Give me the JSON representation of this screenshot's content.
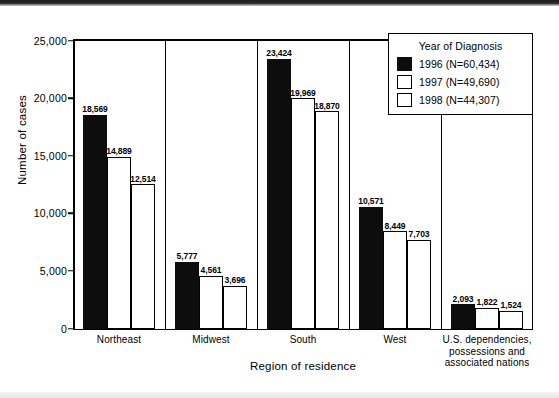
{
  "chart_data": {
    "type": "bar",
    "title": "",
    "xlabel": "Region of residence",
    "ylabel": "Number of cases",
    "ylim": [
      0,
      25000
    ],
    "yticks": [
      "0",
      "5,000",
      "10,000",
      "15,000",
      "20,000",
      "25,000"
    ],
    "ytick_values": [
      0,
      5000,
      10000,
      15000,
      20000,
      25000
    ],
    "grid": false,
    "legend_position": "top-right",
    "legend_title": "Year of Diagnosis",
    "categories": [
      "Northeast",
      "Midwest",
      "South",
      "West",
      "U.S. dependencies, possessions and associated nations"
    ],
    "category_lines": [
      [
        "Northeast"
      ],
      [
        "Midwest"
      ],
      [
        "South"
      ],
      [
        "West"
      ],
      [
        "U.S. dependencies,",
        "possessions and",
        "associated nations"
      ]
    ],
    "series": [
      {
        "name": "1996 (N=60,434)",
        "year": "1996",
        "total": "60,434",
        "color": "#0d0d0d",
        "fill": "dark",
        "values": [
          18569,
          5777,
          23424,
          10571,
          2093
        ],
        "labels": [
          "18,569",
          "5,777",
          "23,424",
          "10,571",
          "2,093"
        ]
      },
      {
        "name": "1997 (N=49,690)",
        "year": "1997",
        "total": "49,690",
        "color": "#ffffff",
        "fill": "light",
        "values": [
          14889,
          4561,
          19969,
          8449,
          1822
        ],
        "labels": [
          "14,889",
          "4,561",
          "19,969",
          "8,449",
          "1,822"
        ]
      },
      {
        "name": "1998 (N=44,307)",
        "year": "1998",
        "total": "44,307",
        "color": "#ffffff",
        "fill": "light",
        "values": [
          12514,
          3696,
          18870,
          7703,
          1524
        ],
        "labels": [
          "12,514",
          "3,696",
          "18,870",
          "7,703",
          "1,524"
        ]
      }
    ]
  }
}
